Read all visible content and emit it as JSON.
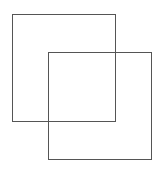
{
  "diagram": {
    "type": "overlapping-squares",
    "stroke_color": "#555555",
    "background": "#ffffff",
    "shapes": [
      {
        "name": "square-1",
        "x": 12,
        "y": 14,
        "width": 104,
        "height": 108
      },
      {
        "name": "square-2",
        "x": 48,
        "y": 52,
        "width": 104,
        "height": 108
      }
    ]
  }
}
